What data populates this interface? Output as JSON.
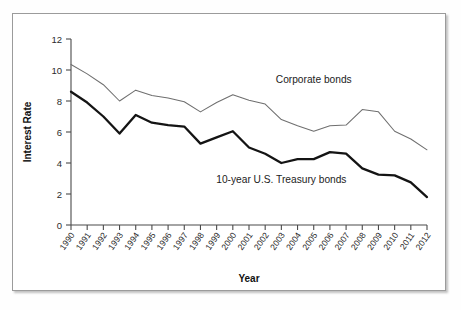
{
  "chart_data": {
    "type": "line",
    "title": "",
    "xlabel": "Year",
    "ylabel": "Interest Rate",
    "ylim": [
      0,
      12
    ],
    "yticks": [
      0,
      2,
      4,
      6,
      8,
      10,
      12
    ],
    "ytick_labels": [
      "0",
      "2",
      "4",
      "6",
      "8",
      "10",
      "12"
    ],
    "grid": false,
    "legend_position": "inline-annotations",
    "categories": [
      "1990",
      "1991",
      "1992",
      "1993",
      "1994",
      "1995",
      "1996",
      "1997",
      "1998",
      "1999",
      "2000",
      "2001",
      "2002",
      "2003",
      "2004",
      "2005",
      "2006",
      "2007",
      "2008",
      "2009",
      "2010",
      "2011",
      "2012"
    ],
    "series": [
      {
        "name": "Corporate bonds",
        "color": "#6f6f6f",
        "style": "thin",
        "values": [
          10.35,
          9.75,
          9.05,
          8.0,
          8.7,
          8.35,
          8.2,
          7.95,
          7.3,
          7.9,
          8.4,
          8.05,
          7.8,
          6.8,
          6.4,
          6.05,
          6.4,
          6.45,
          7.45,
          7.3,
          6.05,
          5.55,
          4.85
        ]
      },
      {
        "name": "10-year U.S. Treasury bonds",
        "color": "#141414",
        "style": "thick",
        "values": [
          8.6,
          7.9,
          7.0,
          5.9,
          7.1,
          6.6,
          6.45,
          6.35,
          5.25,
          5.65,
          6.05,
          5.0,
          4.6,
          4.0,
          4.25,
          4.25,
          4.7,
          4.6,
          3.65,
          3.25,
          3.2,
          2.75,
          1.8
        ]
      }
    ],
    "annotations": [
      {
        "text": "Corporate bonds",
        "x": 2005.0,
        "y": 9.15
      },
      {
        "text": "10-year U.S. Treasury bonds",
        "x": 2003.0,
        "y": 2.7
      }
    ]
  }
}
